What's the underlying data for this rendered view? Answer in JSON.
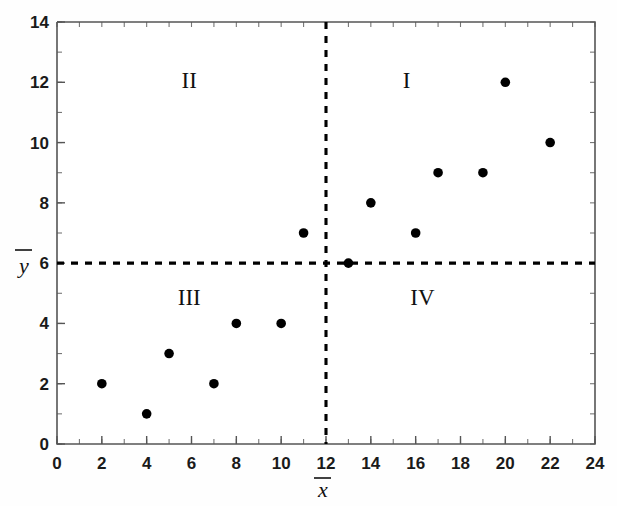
{
  "chart_data": {
    "type": "scatter",
    "title": "",
    "subtitle": "",
    "xlabel": "x̄",
    "ylabel": "ȳ",
    "xlim": [
      0,
      24
    ],
    "ylim": [
      0,
      14
    ],
    "x_major_step": 2,
    "x_minor_step": 1,
    "y_major_step": 2,
    "y_minor_step": 1,
    "grid": false,
    "legend": "none",
    "marker": "filled-circle",
    "marker_color": "#000000",
    "x_tick_labels": [
      "0",
      "2",
      "4",
      "6",
      "8",
      "10",
      "12",
      "14",
      "16",
      "18",
      "20",
      "22",
      "24"
    ],
    "y_tick_labels": [
      "0",
      "2",
      "4",
      "6",
      "8",
      "10",
      "12",
      "14"
    ],
    "x_ticks": [
      0,
      2,
      4,
      6,
      8,
      10,
      12,
      14,
      16,
      18,
      20,
      22,
      24
    ],
    "y_ticks": [
      0,
      2,
      4,
      6,
      8,
      10,
      12,
      14
    ],
    "points": [
      {
        "x": 2,
        "y": 2,
        "quadrant": "III"
      },
      {
        "x": 4,
        "y": 1,
        "quadrant": "III"
      },
      {
        "x": 5,
        "y": 3,
        "quadrant": "III"
      },
      {
        "x": 7,
        "y": 2,
        "quadrant": "III"
      },
      {
        "x": 8,
        "y": 4,
        "quadrant": "III"
      },
      {
        "x": 10,
        "y": 4,
        "quadrant": "III"
      },
      {
        "x": 11,
        "y": 7,
        "quadrant": "II"
      },
      {
        "x": 13,
        "y": 6,
        "quadrant": "on-mean-line"
      },
      {
        "x": 14,
        "y": 8,
        "quadrant": "I"
      },
      {
        "x": 16,
        "y": 7,
        "quadrant": "I"
      },
      {
        "x": 17,
        "y": 9,
        "quadrant": "I"
      },
      {
        "x": 19,
        "y": 9,
        "quadrant": "I"
      },
      {
        "x": 20,
        "y": 12,
        "quadrant": "I"
      },
      {
        "x": 22,
        "y": 10,
        "quadrant": "I"
      }
    ],
    "reference_lines": [
      {
        "name": "x-mean",
        "orientation": "vertical",
        "value": 12,
        "label": "x̄",
        "style": "dashed",
        "color": "#000000"
      },
      {
        "name": "y-mean",
        "orientation": "horizontal",
        "value": 6,
        "label": "ȳ",
        "style": "dashed",
        "color": "#000000"
      }
    ],
    "quadrant_labels": [
      {
        "name": "I",
        "text": "I",
        "x": 15.6,
        "y": 11.8
      },
      {
        "name": "II",
        "text": "II",
        "x": 5.9,
        "y": 11.8
      },
      {
        "name": "III",
        "text": "III",
        "x": 5.9,
        "y": 4.6
      },
      {
        "name": "IV",
        "text": "IV",
        "x": 16.3,
        "y": 4.6
      }
    ]
  },
  "axis": {
    "x_label_text": "x",
    "y_label_text": "y"
  }
}
